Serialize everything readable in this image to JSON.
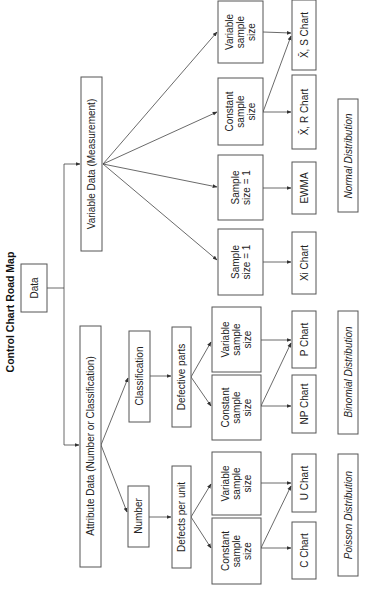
{
  "title": "Control Chart Road Map",
  "root": {
    "label": "Data"
  },
  "categories": {
    "variable": {
      "label": "Variable Data (Measurement)"
    },
    "attribute": {
      "label": "Attribute Data (Number or Classification)"
    }
  },
  "attribute_branches": {
    "classification": {
      "label": "Classification",
      "sub": "Defective parts"
    },
    "number": {
      "label": "Number",
      "sub": "Defects per unit"
    }
  },
  "sample_nodes": {
    "var_variable": [
      "Variable",
      "sample",
      "size"
    ],
    "var_constant": [
      "Constant",
      "sample",
      "size"
    ],
    "var_ewma": [
      "Sample",
      "size = 1"
    ],
    "var_xi": [
      "Sample",
      "size = 1"
    ],
    "cls_variable": [
      "Variable",
      "sample",
      "size"
    ],
    "cls_constant": [
      "Constant",
      "sample",
      "size"
    ],
    "num_variable": [
      "Variable",
      "sample",
      "size"
    ],
    "num_constant": [
      "Constant",
      "sample",
      "size"
    ]
  },
  "charts": {
    "xbar_s": "X̄, S Chart",
    "xbar_r": "X̄, R Chart",
    "ewma": "EWMA",
    "xi": "Xi Chart",
    "p": "P Chart",
    "np": "NP Chart",
    "u": "U Chart",
    "c": "C Chart"
  },
  "distributions": {
    "normal": "Normal Distribution",
    "binomial": "Binomial Distribution",
    "poisson": "Poisson Distribution"
  }
}
